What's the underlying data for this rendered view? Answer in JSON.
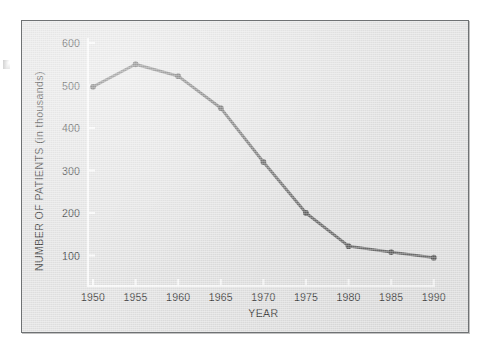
{
  "figure": {
    "panel_background": "#e4e4e4",
    "frame_border_color": "#6f7274",
    "page_background": "#ffffff"
  },
  "chart_data": {
    "type": "line",
    "title": "",
    "xlabel": "YEAR",
    "ylabel": "NUMBER OF PATIENTS (in thousands)",
    "categories": [
      "1950",
      "1955",
      "1960",
      "1965",
      "1970",
      "1975",
      "1980",
      "1985",
      "1990"
    ],
    "x": [
      1950,
      1955,
      1960,
      1965,
      1970,
      1975,
      1980,
      1985,
      1990
    ],
    "values": [
      497,
      550,
      522,
      447,
      320,
      200,
      122,
      108,
      95
    ],
    "series": [
      {
        "name": "Number of patients",
        "values": [
          497,
          550,
          522,
          447,
          320,
          200,
          122,
          108,
          95
        ]
      }
    ],
    "xlim": [
      1950,
      1990
    ],
    "ylim": [
      0,
      600
    ],
    "xtick_labels": [
      "1950",
      "1955",
      "1960",
      "1965",
      "1970",
      "1975",
      "1980",
      "1985",
      "1990"
    ],
    "ytick_labels": [
      "100",
      "200",
      "300",
      "400",
      "500",
      "600"
    ],
    "ytick_values": [
      100,
      200,
      300,
      400,
      500,
      600
    ],
    "grid": false,
    "legend": false,
    "legend_position": "none",
    "line_color": "#6e6e6e",
    "marker_color": "#5f5f5f",
    "axis_color": "#fbfbfb",
    "tick_label_color": "#3d3d3d"
  }
}
